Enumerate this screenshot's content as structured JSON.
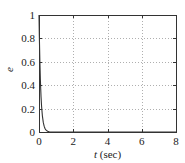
{
  "chart_data": {
    "type": "line",
    "title": "",
    "xlabel": "t (sec)",
    "xlabel_var": "t",
    "xlabel_unit": " (sec)",
    "ylabel": "e",
    "xlim": [
      0,
      8
    ],
    "ylim": [
      0,
      1
    ],
    "xticks": [
      0,
      2,
      4,
      6,
      8
    ],
    "yticks": [
      0,
      0.2,
      0.4,
      0.6,
      0.8,
      1
    ],
    "xtick_labels": [
      "0",
      "2",
      "4",
      "6",
      "8"
    ],
    "ytick_labels": [
      "0",
      "0.2",
      "0.4",
      "0.6",
      "0.8",
      "1"
    ],
    "grid": true,
    "grid_style": "dotted",
    "legend": null,
    "series": [
      {
        "name": "e",
        "color": "#333333",
        "x": [
          0,
          0.02,
          0.05,
          0.08,
          0.1,
          0.12,
          0.15,
          0.2,
          0.25,
          0.3,
          0.35,
          0.4,
          0.5,
          0.6,
          0.8,
          1.0,
          2.0,
          4.0,
          6.0,
          8.0
        ],
        "y": [
          1.0,
          0.82,
          0.61,
          0.45,
          0.37,
          0.3,
          0.22,
          0.135,
          0.082,
          0.05,
          0.03,
          0.018,
          0.0067,
          0.0025,
          0.0003,
          0.0,
          0.0,
          0.0,
          0.0,
          0.0
        ]
      }
    ]
  },
  "layout": {
    "plot_left": 39,
    "plot_top": 15,
    "plot_right": 176,
    "plot_bottom": 132
  },
  "colors": {
    "axis": "#333333",
    "grid": "#9a9a9a",
    "curve": "#333333",
    "text": "#222222"
  }
}
